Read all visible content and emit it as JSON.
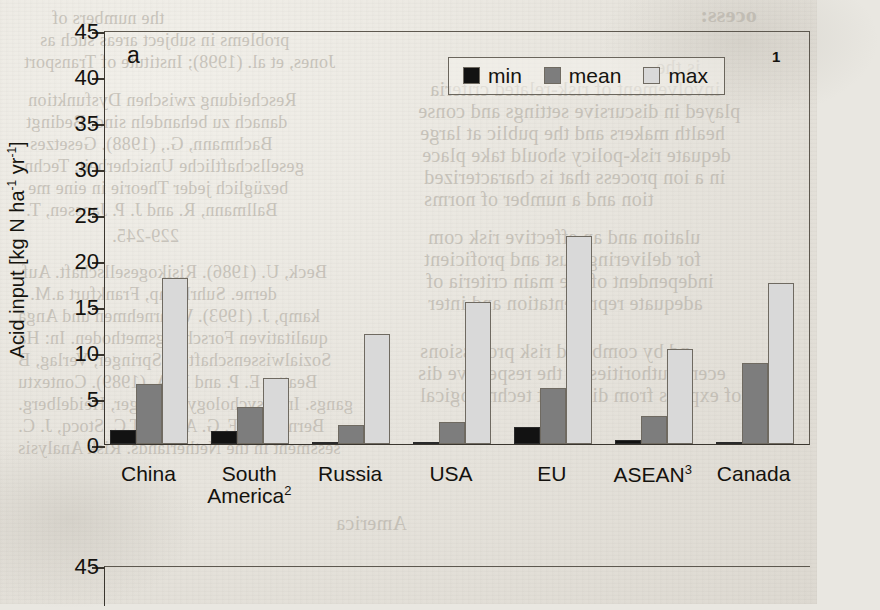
{
  "figure": {
    "panel_letter": "a",
    "y_axis_label_main": "Acid input [kg N ha",
    "y_axis_label_sup1": "-1",
    "y_axis_label_mid": " yr",
    "y_axis_label_sup2": "-1",
    "y_axis_label_end": "]",
    "legend_superscript": "1",
    "panel2_first_tick": "45"
  },
  "legend": {
    "items": [
      {
        "label": "min",
        "color": "#121212"
      },
      {
        "label": "mean",
        "color": "#7d7d7d"
      },
      {
        "label": "max",
        "color": "#d9d9d9"
      }
    ]
  },
  "chart_data": {
    "type": "bar",
    "title": "",
    "xlabel": "",
    "ylabel": "Acid input [kg N ha-1 yr-1]",
    "ylim": [
      0,
      45
    ],
    "yticks": [
      0,
      5,
      10,
      15,
      20,
      25,
      30,
      35,
      40,
      45
    ],
    "ytick_labels": [
      "0",
      "5",
      "10",
      "15",
      "20",
      "25",
      "30",
      "35",
      "40",
      "45"
    ],
    "grid": false,
    "legend_position": "top-right",
    "categories": [
      "China",
      "South America",
      "Russia",
      "USA",
      "EU",
      "ASEAN",
      "Canada"
    ],
    "category_labels": [
      {
        "line1": "China",
        "line2": "",
        "sup": ""
      },
      {
        "line1": "South",
        "line2": "America",
        "sup": "2"
      },
      {
        "line1": "Russia",
        "line2": "",
        "sup": ""
      },
      {
        "line1": "USA",
        "line2": "",
        "sup": ""
      },
      {
        "line1": "EU",
        "line2": "",
        "sup": ""
      },
      {
        "line1": "ASEAN",
        "line2": "",
        "sup": "3"
      },
      {
        "line1": "Canada",
        "line2": "",
        "sup": ""
      }
    ],
    "series": [
      {
        "name": "min",
        "color": "#121212",
        "values": [
          1.5,
          1.4,
          0.2,
          0.1,
          1.8,
          0.4,
          0.1
        ]
      },
      {
        "name": "mean",
        "color": "#7d7d7d",
        "values": [
          6.5,
          4.0,
          2.1,
          2.4,
          6.1,
          3.0,
          8.8
        ]
      },
      {
        "name": "max",
        "color": "#d9d9d9",
        "values": [
          18.0,
          7.2,
          12.0,
          15.4,
          22.6,
          10.3,
          17.5
        ]
      }
    ]
  },
  "background_text": {
    "ghosts": [
      {
        "text": "ocess:",
        "x": 700,
        "y": 2,
        "size": 22,
        "mirror": true,
        "bold": true
      },
      {
        "text": "the numbers of",
        "x": 52,
        "y": 8,
        "size": 18,
        "mirror": true,
        "bold": false
      },
      {
        "text": "problems in subject areas such as",
        "x": 40,
        "y": 30,
        "size": 18,
        "mirror": true,
        "bold": false
      },
      {
        "text": "Jones, et al. (1998); Institute of Transport",
        "x": 24,
        "y": 52,
        "size": 18,
        "mirror": true,
        "bold": false
      },
      {
        "text": "Rescheidung zwischen Dysfunktion",
        "x": 28,
        "y": 90,
        "size": 18,
        "mirror": true,
        "bold": false
      },
      {
        "text": "danach zu behandeln sind. Bedingt",
        "x": 26,
        "y": 112,
        "size": 18,
        "mirror": true,
        "bold": false
      },
      {
        "text": "Bachmann, G., (1988). Gesetzes",
        "x": 30,
        "y": 134,
        "size": 18,
        "mirror": true,
        "bold": false
      },
      {
        "text": "gesellschaftliche Unsicherheit. Techn",
        "x": 24,
        "y": 156,
        "size": 18,
        "mirror": true,
        "bold": false
      },
      {
        "text": "bezüglich jeder Theorie in eine me",
        "x": 28,
        "y": 178,
        "size": 18,
        "mirror": true,
        "bold": false
      },
      {
        "text": "Ballmann, R. and J. P. Janssen, T.",
        "x": 26,
        "y": 200,
        "size": 18,
        "mirror": true,
        "bold": false
      },
      {
        "text": "229-245.",
        "x": 112,
        "y": 226,
        "size": 18,
        "mirror": true,
        "bold": false
      },
      {
        "text": "Beck, U. (1986). Risikogesellschaft. Auf",
        "x": 22,
        "y": 262,
        "size": 18,
        "mirror": true,
        "bold": false
      },
      {
        "text": "derne. Suhrkamp, Frankfurt a.M.",
        "x": 30,
        "y": 284,
        "size": 18,
        "mirror": true,
        "bold": false
      },
      {
        "text": "kamp, J. (1993). Wahrnehmen und Anga",
        "x": 18,
        "y": 306,
        "size": 18,
        "mirror": true,
        "bold": false
      },
      {
        "text": "qualitativen Forschungsmethoden. In: Ha",
        "x": 18,
        "y": 328,
        "size": 18,
        "mirror": true,
        "bold": false
      },
      {
        "text": "Sozialwissenschaften. Springer, Verlag, B",
        "x": 18,
        "y": 350,
        "size": 18,
        "mirror": true,
        "bold": false
      },
      {
        "text": "Beatty, E. P. and R. A. (1989). Contextu",
        "x": 18,
        "y": 372,
        "size": 18,
        "mirror": true,
        "bold": false
      },
      {
        "text": "gangs. In: Psychology, Springer, Heidelberg.",
        "x": 18,
        "y": 394,
        "size": 18,
        "mirror": true,
        "bold": false
      },
      {
        "text": "Bernardus, F. G. Abbas, T.C. Stocq, J. C.",
        "x": 18,
        "y": 416,
        "size": 18,
        "mirror": true,
        "bold": false
      },
      {
        "text": "sessment in the Netherlands. Risk Analysis",
        "x": 18,
        "y": 438,
        "size": 18,
        "mirror": true,
        "bold": false
      },
      {
        "text": "is the",
        "x": 656,
        "y": 56,
        "size": 20,
        "mirror": true,
        "bold": false
      },
      {
        "text": "involvement of risk-related criteria",
        "x": 430,
        "y": 78,
        "size": 20,
        "mirror": true,
        "bold": false
      },
      {
        "text": "played in discursive settings and conse",
        "x": 418,
        "y": 100,
        "size": 20,
        "mirror": true,
        "bold": false
      },
      {
        "text": "health makers and the public at large",
        "x": 420,
        "y": 122,
        "size": 20,
        "mirror": true,
        "bold": false
      },
      {
        "text": "dequate risk-policy should take place",
        "x": 422,
        "y": 144,
        "size": 20,
        "mirror": true,
        "bold": false
      },
      {
        "text": "in a ion process that is characterized",
        "x": 424,
        "y": 166,
        "size": 20,
        "mirror": true,
        "bold": false
      },
      {
        "text": "tion and a number of norms",
        "x": 424,
        "y": 188,
        "size": 20,
        "mirror": true,
        "bold": false
      },
      {
        "text": "ulation and an effective risk com",
        "x": 428,
        "y": 226,
        "size": 20,
        "mirror": true,
        "bold": false
      },
      {
        "text": "for delivering trust and proficient",
        "x": 424,
        "y": 248,
        "size": 20,
        "mirror": true,
        "bold": false
      },
      {
        "text": "independent of the main criteria of",
        "x": 426,
        "y": 270,
        "size": 20,
        "mirror": true,
        "bold": false
      },
      {
        "text": "adequate representation and inter",
        "x": 428,
        "y": 292,
        "size": 20,
        "mirror": true,
        "bold": false
      },
      {
        "text": "nd by combined risk professions",
        "x": 420,
        "y": 340,
        "size": 20,
        "mirror": true,
        "bold": false
      },
      {
        "text": "ecent authorities in the respective dis",
        "x": 418,
        "y": 362,
        "size": 20,
        "mirror": true,
        "bold": false
      },
      {
        "text": "of experts from different technological",
        "x": 420,
        "y": 384,
        "size": 20,
        "mirror": true,
        "bold": false
      },
      {
        "text": "America",
        "x": 336,
        "y": 512,
        "size": 20,
        "mirror": true,
        "bold": false
      }
    ]
  }
}
